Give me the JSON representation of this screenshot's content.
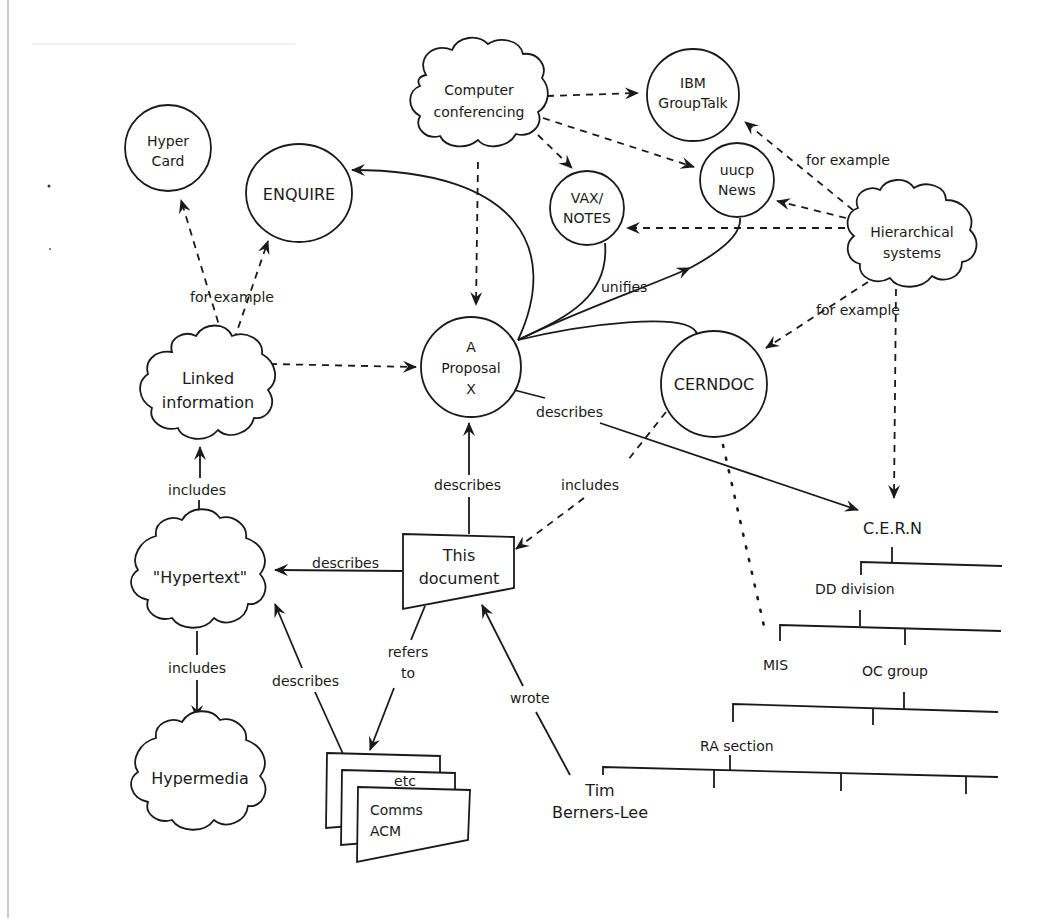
{
  "nodes": {
    "hypercard": {
      "lines": [
        "Hyper",
        "Card"
      ],
      "shape": "circle"
    },
    "enquire": {
      "lines": [
        "ENQUIRE"
      ],
      "shape": "circle"
    },
    "computer_conferencing": {
      "lines": [
        "Computer",
        "conferencing"
      ],
      "shape": "cloud"
    },
    "ibm_grouptalk": {
      "lines": [
        "IBM",
        "GroupTalk"
      ],
      "shape": "circle"
    },
    "vax_notes": {
      "lines": [
        "VAX/",
        "NOTES"
      ],
      "shape": "circle"
    },
    "uucp_news": {
      "lines": [
        "uucp",
        "News"
      ],
      "shape": "circle"
    },
    "hierarchical_systems": {
      "lines": [
        "Hierarchical",
        "systems"
      ],
      "shape": "cloud"
    },
    "linked_information": {
      "lines": [
        "Linked",
        "information"
      ],
      "shape": "cloud"
    },
    "proposal": {
      "lines": [
        "A",
        "Proposal",
        "X"
      ],
      "shape": "circle"
    },
    "cerndoc": {
      "lines": [
        "CERNDOC"
      ],
      "shape": "circle"
    },
    "this_document": {
      "lines": [
        "This",
        "document"
      ],
      "shape": "document"
    },
    "hypertext": {
      "lines": [
        "\"Hypertext\""
      ],
      "shape": "cloud"
    },
    "hypermedia": {
      "lines": [
        "Hypermedia"
      ],
      "shape": "cloud"
    },
    "comms_acm": {
      "lines": [
        "Comms",
        "ACM"
      ],
      "back_label": "etc",
      "shape": "document-stack"
    },
    "tim_berners_lee": {
      "lines": [
        "Tim",
        "Berners-Lee"
      ],
      "shape": "text"
    },
    "cern": {
      "lines": [
        "C.E.R.N"
      ],
      "shape": "text"
    },
    "dd_division": {
      "lines": [
        "DD division"
      ],
      "shape": "text"
    },
    "mis": {
      "lines": [
        "MIS"
      ],
      "shape": "text"
    },
    "oc_group": {
      "lines": [
        "OC group"
      ],
      "shape": "text"
    },
    "ra_section": {
      "lines": [
        "RA section"
      ],
      "shape": "text"
    }
  },
  "edges": [
    {
      "from": "computer_conferencing",
      "to": "ibm_grouptalk",
      "style": "dashed",
      "label": ""
    },
    {
      "from": "computer_conferencing",
      "to": "uucp_news",
      "style": "dashed",
      "label": ""
    },
    {
      "from": "computer_conferencing",
      "to": "vax_notes",
      "style": "dashed",
      "label": ""
    },
    {
      "from": "computer_conferencing",
      "to": "proposal",
      "style": "dashed",
      "label": ""
    },
    {
      "from": "hierarchical_systems",
      "to": "ibm_grouptalk",
      "style": "dashed",
      "label": "for example"
    },
    {
      "from": "hierarchical_systems",
      "to": "uucp_news",
      "style": "dashed",
      "label": ""
    },
    {
      "from": "hierarchical_systems",
      "to": "vax_notes",
      "style": "dashed",
      "label": ""
    },
    {
      "from": "hierarchical_systems",
      "to": "cerndoc",
      "style": "dashed",
      "label": "for example"
    },
    {
      "from": "hierarchical_systems",
      "to": "cern",
      "style": "dashed",
      "label": ""
    },
    {
      "from": "linked_information",
      "to": "hypercard",
      "style": "dashed",
      "label": "for example"
    },
    {
      "from": "linked_information",
      "to": "enquire",
      "style": "dashed",
      "label": "for example"
    },
    {
      "from": "linked_information",
      "to": "proposal",
      "style": "dashed",
      "label": ""
    },
    {
      "from": "proposal",
      "to": "enquire",
      "style": "solid",
      "label": "unifies"
    },
    {
      "from": "proposal",
      "to": "vax_notes",
      "style": "solid",
      "label": "unifies"
    },
    {
      "from": "proposal",
      "to": "uucp_news",
      "style": "solid",
      "label": "unifies"
    },
    {
      "from": "proposal",
      "to": "cerndoc",
      "style": "solid",
      "label": "unifies"
    },
    {
      "from": "proposal",
      "to": "cern",
      "style": "solid",
      "label": "describes"
    },
    {
      "from": "this_document",
      "to": "proposal",
      "style": "solid",
      "label": "describes"
    },
    {
      "from": "cerndoc",
      "to": "this_document",
      "style": "dashed",
      "label": "includes"
    },
    {
      "from": "cerndoc",
      "to": "mis",
      "style": "dotted",
      "label": ""
    },
    {
      "from": "this_document",
      "to": "hypertext",
      "style": "solid",
      "label": "describes"
    },
    {
      "from": "this_document",
      "to": "comms_acm",
      "style": "solid",
      "label": "refers to"
    },
    {
      "from": "comms_acm",
      "to": "hypertext",
      "style": "solid",
      "label": "describes"
    },
    {
      "from": "tim_berners_lee",
      "to": "this_document",
      "style": "solid",
      "label": "wrote"
    },
    {
      "from": "hypertext",
      "to": "linked_information",
      "style": "solid",
      "label": "includes"
    },
    {
      "from": "hypertext",
      "to": "hypermedia",
      "style": "solid",
      "label": "includes"
    }
  ],
  "edge_labels": {
    "for_example_left": "for example",
    "for_example_top_right": "for example",
    "for_example_right": "for example",
    "unifies": "unifies",
    "describes_cern": "describes",
    "describes_proposal": "describes",
    "includes_cerndoc": "includes",
    "describes_hypertext": "describes",
    "refers_to_1": "refers",
    "refers_to_2": "to",
    "describes_comms": "describes",
    "wrote": "wrote",
    "includes_linked": "includes",
    "includes_hypermedia": "includes"
  },
  "colors": {
    "ink": "#1a1a1a",
    "background": "#ffffff",
    "frame": "#b8b8b8"
  }
}
